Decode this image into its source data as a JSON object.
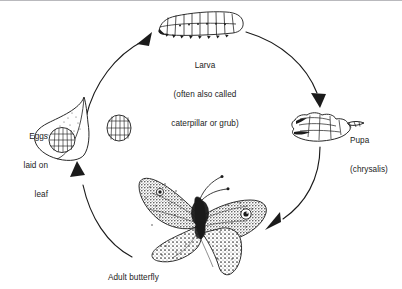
{
  "diagram": {
    "background_color": "#ffffff",
    "ink_color": "#1b1b1b",
    "border_color": "#b9b9bd",
    "stage_count": 4,
    "direction": "clockwise"
  },
  "stages": {
    "larva": {
      "label_line1": "Larva",
      "label_line2": "(often also called",
      "label_line3": "caterpillar or grub)",
      "figure": "caterpillar-figure"
    },
    "pupa": {
      "label_line1": "Pupa",
      "label_line2": "(chrysalis)",
      "figure": "chrysalis-figure"
    },
    "adult": {
      "label_line1": "Adult butterfly",
      "figure": "butterfly-figure"
    },
    "eggs": {
      "label_line1": "Eggs",
      "label_line2": "laid on",
      "label_line3": "leaf",
      "figure": "leaf-with-eggs-figure",
      "detail_figure": "egg-cluster-figure"
    }
  },
  "arrows": {
    "eggs_to_larva": "arrow-up-right-icon",
    "larva_to_pupa": "arrow-down-icon",
    "pupa_to_adult": "arrow-down-left-icon",
    "adult_to_eggs": "arrow-up-icon"
  }
}
